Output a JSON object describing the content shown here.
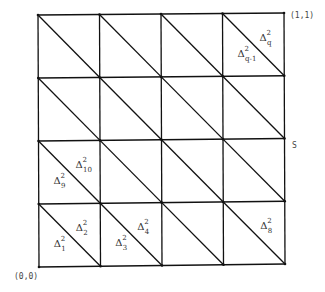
{
  "diagram": {
    "type": "triangulated-unit-square",
    "grid_divisions": 4,
    "corner_labels": {
      "bottom_left": "(0,0)",
      "top_right": "(1,1)"
    },
    "side_label": "S",
    "triangle_labels": [
      {
        "symbol": "Δ",
        "sup": "2",
        "sub": "1",
        "cell": [
          0,
          0
        ],
        "half": "lower"
      },
      {
        "symbol": "Δ",
        "sup": "2",
        "sub": "2",
        "cell": [
          0,
          0
        ],
        "half": "upper"
      },
      {
        "symbol": "Δ",
        "sup": "2",
        "sub": "3",
        "cell": [
          1,
          0
        ],
        "half": "lower"
      },
      {
        "symbol": "Δ",
        "sup": "2",
        "sub": "4",
        "cell": [
          1,
          0
        ],
        "half": "upper"
      },
      {
        "symbol": "Δ",
        "sup": "2",
        "sub": "8",
        "cell": [
          3,
          0
        ],
        "half": "upper"
      },
      {
        "symbol": "Δ",
        "sup": "2",
        "sub": "9",
        "cell": [
          0,
          1
        ],
        "half": "lower"
      },
      {
        "symbol": "Δ",
        "sup": "2",
        "sub": "10",
        "cell": [
          0,
          1
        ],
        "half": "upper"
      },
      {
        "symbol": "Δ",
        "sup": "2",
        "sub": "q-1",
        "cell": [
          3,
          3
        ],
        "half": "lower"
      },
      {
        "symbol": "Δ",
        "sup": "2",
        "sub": "q",
        "cell": [
          3,
          3
        ],
        "half": "upper"
      }
    ]
  }
}
